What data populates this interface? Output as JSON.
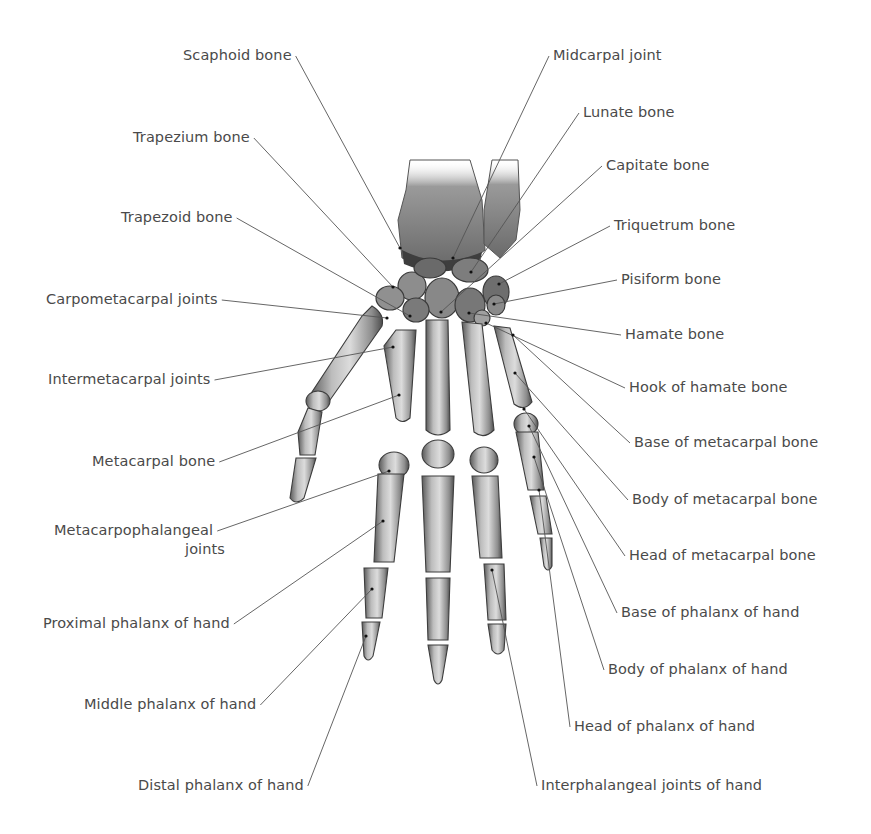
{
  "diagram": {
    "colors": {
      "background": "#ffffff",
      "label_text": "#4a4a4a",
      "leader_line": "#555555",
      "bone_light": "#d6d6d6",
      "bone_mid": "#9a9a9a",
      "bone_dark": "#4a4a4a"
    },
    "labels_left": [
      {
        "id": "scaphoid",
        "text": "Scaphoid bone",
        "x": 183,
        "y": 46,
        "target": [
          400,
          248
        ]
      },
      {
        "id": "trapezium",
        "text": "Trapezium bone",
        "x": 133,
        "y": 128,
        "target": [
          393,
          287
        ]
      },
      {
        "id": "trapezoid",
        "text": "Trapezoid bone",
        "x": 121,
        "y": 208,
        "target": [
          410,
          316
        ]
      },
      {
        "id": "carpometacarpal",
        "text": "Carpometacarpal joints",
        "x": 46,
        "y": 290,
        "target": [
          387,
          318
        ]
      },
      {
        "id": "intermetacarpal",
        "text": "Intermetacarpal joints",
        "x": 48,
        "y": 370,
        "target": [
          393,
          347
        ]
      },
      {
        "id": "metacarpal",
        "text": "Metacarpal bone",
        "x": 92,
        "y": 452,
        "target": [
          399,
          395
        ]
      },
      {
        "id": "mcp_joints_1",
        "text": "Metacarpophalangeal",
        "x": 54,
        "y": 521,
        "target": [
          389,
          471
        ]
      },
      {
        "id": "mcp_joints_2",
        "text": "joints",
        "x": 185,
        "y": 540
      },
      {
        "id": "proximal_phalanx",
        "text": "Proximal phalanx of hand",
        "x": 43,
        "y": 614,
        "target": [
          383,
          521
        ]
      },
      {
        "id": "middle_phalanx",
        "text": "Middle phalanx of hand",
        "x": 84,
        "y": 695,
        "target": [
          372,
          589
        ]
      },
      {
        "id": "distal_phalanx",
        "text": "Distal phalanx of hand",
        "x": 138,
        "y": 776,
        "target": [
          366,
          636
        ]
      }
    ],
    "labels_right": [
      {
        "id": "midcarpal",
        "text": "Midcarpal joint",
        "x": 553,
        "y": 46,
        "target": [
          453,
          258
        ]
      },
      {
        "id": "lunate",
        "text": "Lunate bone",
        "x": 583,
        "y": 103,
        "target": [
          471,
          272
        ]
      },
      {
        "id": "capitate",
        "text": "Capitate bone",
        "x": 606,
        "y": 156,
        "target": [
          441,
          312
        ]
      },
      {
        "id": "triquetrum",
        "text": "Triquetrum bone",
        "x": 614,
        "y": 216,
        "target": [
          499,
          284
        ]
      },
      {
        "id": "pisiform",
        "text": "Pisiform bone",
        "x": 621,
        "y": 270,
        "target": [
          494,
          304
        ]
      },
      {
        "id": "hamate",
        "text": "Hamate bone",
        "x": 625,
        "y": 325,
        "target": [
          469,
          313
        ]
      },
      {
        "id": "hook_of_hamate",
        "text": "Hook of hamate bone",
        "x": 629,
        "y": 378,
        "target": [
          486,
          323
        ]
      },
      {
        "id": "base_metacarpal",
        "text": "Base of metacarpal bone",
        "x": 634,
        "y": 433,
        "target": [
          513,
          335
        ]
      },
      {
        "id": "body_metacarpal",
        "text": "Body of metacarpal bone",
        "x": 632,
        "y": 490,
        "target": [
          515,
          373
        ]
      },
      {
        "id": "head_metacarpal",
        "text": "Head of metacarpal bone",
        "x": 629,
        "y": 546,
        "target": [
          524,
          409
        ]
      },
      {
        "id": "base_phalanx",
        "text": "Base of phalanx of hand",
        "x": 621,
        "y": 603,
        "target": [
          529,
          426
        ]
      },
      {
        "id": "body_phalanx",
        "text": "Body of phalanx of hand",
        "x": 608,
        "y": 660,
        "target": [
          534,
          457
        ]
      },
      {
        "id": "head_phalanx",
        "text": "Head of phalanx of hand",
        "x": 574,
        "y": 717,
        "target": [
          539,
          490
        ]
      },
      {
        "id": "interphalangeal",
        "text": "Interphalangeal joints of hand",
        "x": 541,
        "y": 776,
        "target": [
          492,
          570
        ]
      }
    ]
  }
}
